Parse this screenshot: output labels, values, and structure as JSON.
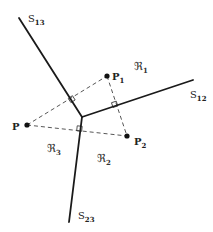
{
  "diagram": {
    "type": "voronoi-diagram",
    "points": [
      {
        "id": "P",
        "label": "P",
        "sub": "",
        "x": 27,
        "y": 125
      },
      {
        "id": "P1",
        "label": "P",
        "sub": "1",
        "x": 107,
        "y": 76
      },
      {
        "id": "P2",
        "label": "P",
        "sub": "2",
        "x": 127,
        "y": 136
      }
    ],
    "junction": {
      "x": 82,
      "y": 117
    },
    "edges": [
      {
        "id": "S13",
        "label": "S",
        "sub": "13",
        "x2": 19,
        "y2": 18
      },
      {
        "id": "S12",
        "label": "S",
        "sub": "12",
        "x2": 193,
        "y2": 80
      },
      {
        "id": "S23",
        "label": "S",
        "sub": "23",
        "x2": 69,
        "y2": 222
      }
    ],
    "regions": [
      {
        "id": "R1",
        "label": "ℜ",
        "sub": "1"
      },
      {
        "id": "R2",
        "label": "ℜ",
        "sub": "2"
      },
      {
        "id": "R3",
        "label": "ℜ",
        "sub": "3"
      }
    ],
    "colors": {
      "line": "#1a1a1a",
      "dashed": "#444444"
    }
  }
}
